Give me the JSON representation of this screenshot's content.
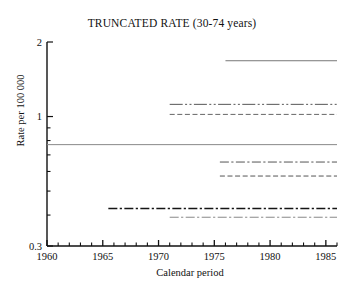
{
  "chart_data": {
    "type": "line",
    "title": "TRUNCATED RATE (30-74 years)",
    "xlabel": "Calendar period",
    "ylabel": "Rate per 100 000",
    "yscale": "log",
    "ylim": [
      0.3,
      2
    ],
    "xlim": [
      1960,
      1986
    ],
    "grid": false,
    "legend": "none",
    "ytick_labels": [
      "2",
      "1",
      "0.3"
    ],
    "ytick_values": [
      2,
      1,
      0.3
    ],
    "ytick_minor_values": [
      0.9,
      0.8,
      0.7,
      0.6,
      0.5,
      0.4
    ],
    "xtick_labels": [
      "1960",
      "1965",
      "1970",
      "1975",
      "1980",
      "1985"
    ],
    "xtick_values": [
      1960,
      1965,
      1970,
      1975,
      1980,
      1985
    ],
    "xtick_minor_step": 1,
    "series": [
      {
        "name": "series-1",
        "style": "solid",
        "color": "#777777",
        "width": 1.0,
        "value": 1.68,
        "x_start": 1976.0,
        "x_end": 1986.0
      },
      {
        "name": "series-2",
        "style": "dash-dot-dot",
        "color": "#555555",
        "width": 1.0,
        "value": 1.12,
        "x_start": 1971.0,
        "x_end": 1986.0
      },
      {
        "name": "series-3",
        "style": "dashed",
        "color": "#666666",
        "width": 1.0,
        "value": 1.02,
        "x_start": 1971.0,
        "x_end": 1986.0
      },
      {
        "name": "series-4",
        "style": "solid",
        "color": "#888888",
        "width": 1.0,
        "value": 0.77,
        "x_start": 1960.0,
        "x_end": 1986.0
      },
      {
        "name": "series-5",
        "style": "dash-dot",
        "color": "#555555",
        "width": 1.0,
        "value": 0.655,
        "x_start": 1975.5,
        "x_end": 1986.0
      },
      {
        "name": "series-6",
        "style": "dashed",
        "color": "#555555",
        "width": 1.0,
        "value": 0.575,
        "x_start": 1975.5,
        "x_end": 1986.0
      },
      {
        "name": "series-7",
        "style": "dash-dot",
        "color": "#151515",
        "width": 1.6,
        "value": 0.425,
        "x_start": 1965.5,
        "x_end": 1986.0
      },
      {
        "name": "series-8",
        "style": "dash-dot",
        "color": "#888888",
        "width": 1.0,
        "value": 0.392,
        "x_start": 1971.0,
        "x_end": 1986.0
      }
    ]
  }
}
